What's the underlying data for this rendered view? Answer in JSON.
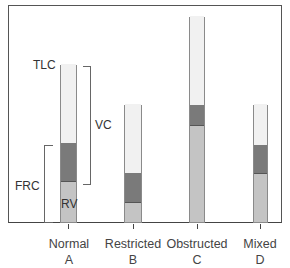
{
  "chart_data": {
    "type": "bar",
    "stacked": true,
    "title": "",
    "xlabel": "",
    "ylabel": "",
    "grid": false,
    "legend": "none",
    "categories": [
      "Normal\nA",
      "Restricted\nB",
      "Obstructed\nC",
      "Mixed\nD"
    ],
    "category_names": [
      "Normal",
      "Restricted",
      "Obstructed",
      "Mixed"
    ],
    "category_letters": [
      "A",
      "B",
      "C",
      "D"
    ],
    "ylim": [
      0,
      206
    ],
    "series": [
      {
        "name": "RV",
        "color": "#c4c4c4",
        "values": [
          40,
          19,
          96,
          48
        ]
      },
      {
        "name": "ERV",
        "color": "#7a7a7a",
        "values": [
          39,
          30,
          21,
          29
        ]
      },
      {
        "name": "IC",
        "color": "#f1f1f1",
        "values": [
          79,
          69,
          89,
          41
        ]
      }
    ],
    "totals_TLC": [
      158,
      118,
      206,
      118
    ],
    "annotations": [
      {
        "text": "TLC",
        "target": "Normal top"
      },
      {
        "text": "VC",
        "type": "bracket",
        "target": "Normal ERV+IC"
      },
      {
        "text": "FRC",
        "type": "bracket",
        "target": "Normal RV+ERV"
      },
      {
        "text": "RV",
        "target": "Normal RV segment"
      }
    ]
  },
  "labels": {
    "tlc": "TLC",
    "vc": "VC",
    "frc": "FRC",
    "rv": "RV",
    "cat": [
      {
        "name": "Normal",
        "letter": "A"
      },
      {
        "name": "Restricted",
        "letter": "B"
      },
      {
        "name": "Obstructed",
        "letter": "C"
      },
      {
        "name": "Mixed",
        "letter": "D"
      }
    ]
  }
}
